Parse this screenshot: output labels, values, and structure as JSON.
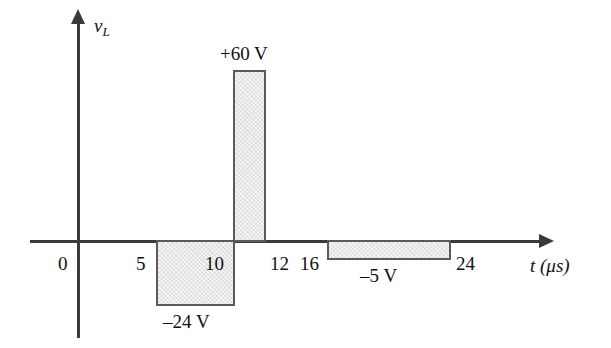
{
  "figure": {
    "type": "waveform-plot",
    "background_color": "#ffffff",
    "line_color": "#3a3a3a",
    "bar_fill_color": "#dcdcdc",
    "bar_border_color": "#5a5a5a"
  },
  "axes": {
    "y_label": "v",
    "y_label_subscript": "L",
    "x_label": "t (μs)",
    "x_ticks": [
      "0",
      "5",
      "10",
      "12",
      "16",
      "24"
    ]
  },
  "bars": [
    {
      "name": "bar-neg24",
      "label": "–24 V"
    },
    {
      "name": "bar-pos60",
      "label": "+60 V"
    },
    {
      "name": "bar-neg5",
      "label": "–5 V"
    }
  ],
  "chart_data": {
    "type": "bar",
    "title": "",
    "xlabel": "t (μs)",
    "ylabel": "v_L",
    "xlim": [
      0,
      26
    ],
    "ylim": [
      -24,
      60
    ],
    "grid": false,
    "legend": null,
    "x_tick_labels": [
      "0",
      "5",
      "10",
      "12",
      "16",
      "24"
    ],
    "x_tick_values": [
      0,
      5,
      10,
      12,
      16,
      24
    ],
    "annotations": [
      "+60 V",
      "–24 V",
      "–5 V"
    ],
    "segments": [
      {
        "t_start": 0,
        "t_end": 5,
        "value": 0,
        "label": ""
      },
      {
        "t_start": 5,
        "t_end": 11,
        "value": -24,
        "label": "–24 V"
      },
      {
        "t_start": 11,
        "t_end": 12,
        "value": 60,
        "label": "+60 V"
      },
      {
        "t_start": 12,
        "t_end": 16,
        "value": 0,
        "label": ""
      },
      {
        "t_start": 16,
        "t_end": 24,
        "value": -5,
        "label": "–5 V"
      },
      {
        "t_start": 24,
        "t_end": 26,
        "value": 0,
        "label": ""
      }
    ],
    "categories": [
      "0–5",
      "5–11",
      "11–12",
      "12–16",
      "16–24",
      "24+"
    ],
    "values": [
      0,
      -24,
      60,
      0,
      -5,
      0
    ]
  }
}
